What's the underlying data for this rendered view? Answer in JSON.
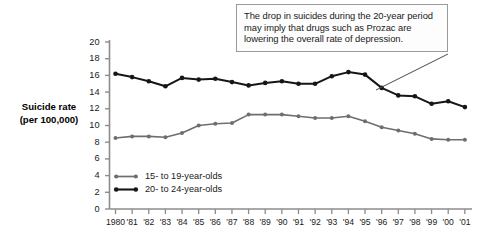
{
  "annotation": {
    "text": "The drop in suicides during the 20-year period may imply that drugs such as Prozac are lowering the overall rate of depression."
  },
  "axis": {
    "y_title_line1": "Suicide rate",
    "y_title_line2": "(per 100,000)"
  },
  "legend": {
    "items": [
      {
        "label": "15- to 19-year-olds",
        "color": "#6e6e6e"
      },
      {
        "label": "20- to 24-year-olds",
        "color": "#161616"
      }
    ]
  },
  "chart_data": {
    "type": "line",
    "title": "",
    "xlabel": "",
    "ylabel": "Suicide rate (per 100,000)",
    "ylim": [
      0,
      20
    ],
    "ytick_step": 2,
    "yticks": [
      0,
      2,
      4,
      6,
      8,
      10,
      12,
      14,
      16,
      18,
      20
    ],
    "grid": false,
    "legend_position": "inside-lower-left",
    "categories": [
      "1980",
      "'81",
      "'82",
      "'83",
      "'84",
      "'85",
      "'86",
      "'87",
      "'88",
      "'89",
      "'90",
      "'91",
      "'92",
      "'93",
      "'94",
      "'95",
      "'96",
      "'97",
      "'98",
      "'99",
      "'00",
      "'01"
    ],
    "x": [
      1980,
      1981,
      1982,
      1983,
      1984,
      1985,
      1986,
      1987,
      1988,
      1989,
      1990,
      1991,
      1992,
      1993,
      1994,
      1995,
      1996,
      1997,
      1998,
      1999,
      2000,
      2001
    ],
    "series": [
      {
        "name": "15- to 19-year-olds",
        "color": "#6e6e6e",
        "values": [
          8.5,
          8.7,
          8.7,
          8.6,
          9.1,
          10.0,
          10.2,
          10.3,
          11.3,
          11.3,
          11.3,
          11.1,
          10.9,
          10.9,
          11.1,
          10.5,
          9.8,
          9.4,
          9.0,
          8.4,
          8.3,
          8.3
        ]
      },
      {
        "name": "20- to 24-year-olds",
        "color": "#161616",
        "values": [
          16.2,
          15.8,
          15.3,
          14.7,
          15.7,
          15.5,
          15.6,
          15.2,
          14.8,
          15.1,
          15.3,
          15.0,
          15.0,
          15.9,
          16.4,
          16.1,
          14.5,
          13.6,
          13.5,
          12.6,
          12.9,
          12.2
        ]
      }
    ]
  }
}
